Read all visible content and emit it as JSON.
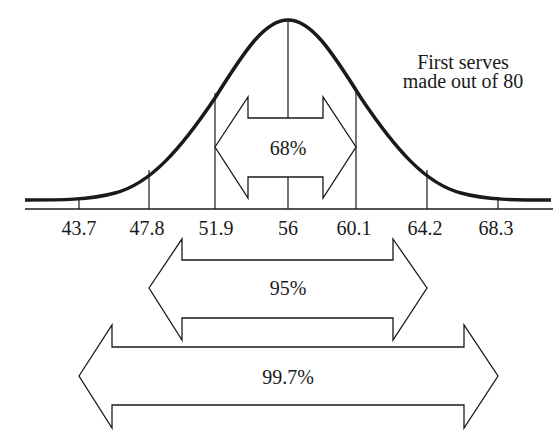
{
  "diagram": {
    "type": "normal-distribution-empirical-rule",
    "annotation": {
      "line1": "First serves",
      "line2": "made out of 80"
    },
    "axis_ticks": [
      "43.7",
      "47.8",
      "51.9",
      "56",
      "60.1",
      "64.2",
      "68.3"
    ],
    "mean": "56",
    "ranges": [
      {
        "label": "68%",
        "from": "51.9",
        "to": "60.1"
      },
      {
        "label": "95%",
        "from": "47.8",
        "to": "64.2"
      },
      {
        "label": "99.7%",
        "from": "43.7",
        "to": "68.3"
      }
    ],
    "colors": {
      "line": "#1a1a1a",
      "background": "#ffffff"
    }
  }
}
